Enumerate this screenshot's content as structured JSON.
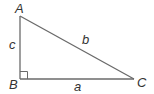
{
  "figure": {
    "type": "right-triangle",
    "line_color": "#6a6a6a",
    "vertices": [
      {
        "label": "A",
        "role": "top"
      },
      {
        "label": "B",
        "role": "right-angle"
      },
      {
        "label": "C",
        "role": "right"
      }
    ],
    "sides": [
      {
        "label": "c",
        "between": "A-B"
      },
      {
        "label": "b",
        "between": "A-C"
      },
      {
        "label": "a",
        "between": "B-C"
      }
    ],
    "right_angle_at": "B"
  }
}
